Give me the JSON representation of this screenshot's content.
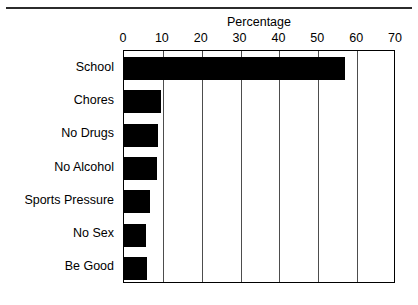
{
  "chart_data": {
    "type": "bar",
    "orientation": "horizontal",
    "title": "Percentage",
    "xlabel": "Percentage",
    "ylabel": "",
    "xlim": [
      0,
      70
    ],
    "xticks": [
      0,
      10,
      20,
      30,
      40,
      50,
      60,
      70
    ],
    "xtick_labels": [
      "0",
      "10",
      "20",
      "30",
      "40",
      "50",
      "60",
      "70"
    ],
    "grid": true,
    "legend": false,
    "bar_color": "#000000",
    "categories": [
      "School",
      "Chores",
      "No Drugs",
      "No Alcohol",
      "Sports Pressure",
      "No Sex",
      "Be Good"
    ],
    "values": [
      57,
      9.5,
      8.8,
      8.5,
      6.8,
      5.7,
      6
    ]
  },
  "figure": {
    "background_color": "#ffffff",
    "frame_color": "#000000",
    "top_rule_color": "#2b2b2b"
  }
}
